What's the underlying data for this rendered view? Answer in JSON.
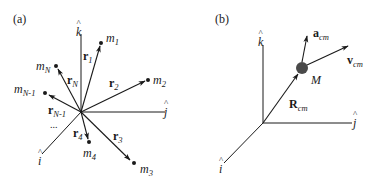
{
  "panel_a": {
    "label": "(a)",
    "axes": {
      "i": "i",
      "j": "j",
      "k": "k"
    },
    "masses": [
      {
        "name": "m",
        "sub": "1"
      },
      {
        "name": "m",
        "sub": "2"
      },
      {
        "name": "m",
        "sub": "3"
      },
      {
        "name": "m",
        "sub": "4"
      },
      {
        "name": "m",
        "sub": "N-1"
      },
      {
        "name": "m",
        "sub": "N"
      }
    ],
    "vectors": [
      {
        "name": "r",
        "sub": "1"
      },
      {
        "name": "r",
        "sub": "2"
      },
      {
        "name": "r",
        "sub": "3"
      },
      {
        "name": "r",
        "sub": "4"
      },
      {
        "name": "r",
        "sub": "N-1"
      },
      {
        "name": "r",
        "sub": "N"
      }
    ],
    "ellipsis": "..."
  },
  "panel_b": {
    "label": "(b)",
    "axes": {
      "i": "i",
      "j": "j",
      "k": "k"
    },
    "mass": "M",
    "position_vector": {
      "name": "R",
      "sub": "cm"
    },
    "velocity_vector": {
      "name": "v",
      "sub": "cm"
    },
    "acceleration_vector": {
      "name": "a",
      "sub": "cm"
    }
  },
  "colors": {
    "line": "#1a1a1a",
    "mass_ball": "#4a4a4a"
  }
}
